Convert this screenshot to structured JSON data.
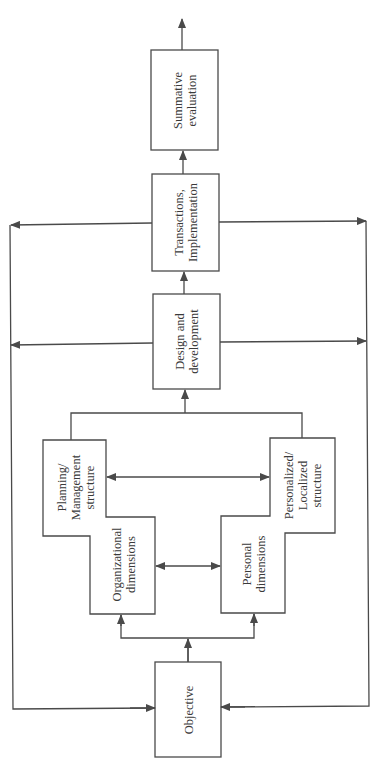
{
  "diagram": {
    "orientation": "rotated-90-ccw",
    "stroke_color": "#4a4a4a",
    "background": "#ffffff",
    "nodes": {
      "objective": {
        "label": "Objective"
      },
      "organizational_dimensions": {
        "label": "Organizational\ndimensions"
      },
      "planning_management_structure": {
        "label": "Planning/\nManagement\nstructure"
      },
      "personal_dimensions": {
        "label": "Personal\ndimensions"
      },
      "personalized_localized_structure": {
        "label": "Personalized/\nLocalized\nstructure"
      },
      "design_and_development": {
        "label": "Design and\ndevelopment"
      },
      "transactions_implementation": {
        "label": "Transactions,\nImplementation"
      },
      "summative_evaluation": {
        "label": "Summative\nevaluation"
      }
    },
    "edges": [
      {
        "from": "objective",
        "to": "organizational_dimensions",
        "type": "arrow"
      },
      {
        "from": "objective",
        "to": "personal_dimensions",
        "type": "arrow"
      },
      {
        "from": "organizational_dimensions",
        "to": "personal_dimensions",
        "type": "double-arrow"
      },
      {
        "from": "planning_management_structure",
        "to": "personalized_localized_structure",
        "type": "double-arrow"
      },
      {
        "from": "planning_management_structure",
        "to": "design_and_development",
        "type": "arrow"
      },
      {
        "from": "personalized_localized_structure",
        "to": "design_and_development",
        "type": "arrow"
      },
      {
        "from": "design_and_development",
        "to": "transactions_implementation",
        "type": "arrow"
      },
      {
        "from": "transactions_implementation",
        "to": "summative_evaluation",
        "type": "arrow"
      },
      {
        "from": "summative_evaluation",
        "to": "output",
        "type": "arrow"
      },
      {
        "from": "design_and_development",
        "to": "objective",
        "type": "feedback-left"
      },
      {
        "from": "design_and_development",
        "to": "objective",
        "type": "feedback-right"
      },
      {
        "from": "transactions_implementation",
        "to": "objective",
        "type": "feedback-left"
      },
      {
        "from": "transactions_implementation",
        "to": "objective",
        "type": "feedback-right"
      }
    ]
  }
}
